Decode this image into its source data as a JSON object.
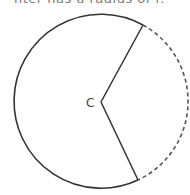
{
  "caption": {
    "text": "nter has a radius of r."
  },
  "diagram": {
    "center_label": "C",
    "circle": {
      "cx": 101,
      "cy": 101,
      "r": 87
    },
    "radius_endpoints": [
      {
        "x": 143,
        "y": 25
      },
      {
        "x": 138,
        "y": 182
      }
    ],
    "vertex": {
      "x": 101,
      "y": 102
    },
    "solid_arc_color": "#333333",
    "dashed_arc_color": "#555555"
  }
}
